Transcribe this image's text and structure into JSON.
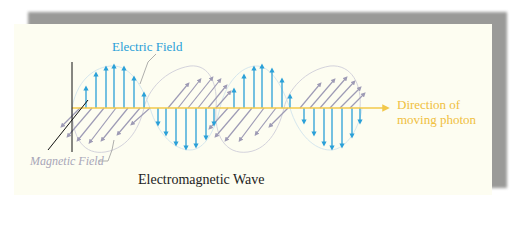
{
  "diagram": {
    "title": "Electromagnetic Wave",
    "labels": {
      "electric_field": "Electric Field",
      "magnetic_field": "Magnetic Field",
      "direction_line1": "Direction of",
      "direction_line2": "moving photon"
    },
    "colors": {
      "electric": "#2aa0d8",
      "magnetic": "#9e9bb5",
      "propagation_axis": "#f2c84a",
      "axes": "#111111",
      "panel": "#fdfdf1",
      "shadow": "#9a9a98"
    },
    "components": [
      "electric-field-wave",
      "magnetic-field-wave",
      "propagation-axis",
      "vertical-axis",
      "diagonal-axis"
    ]
  }
}
